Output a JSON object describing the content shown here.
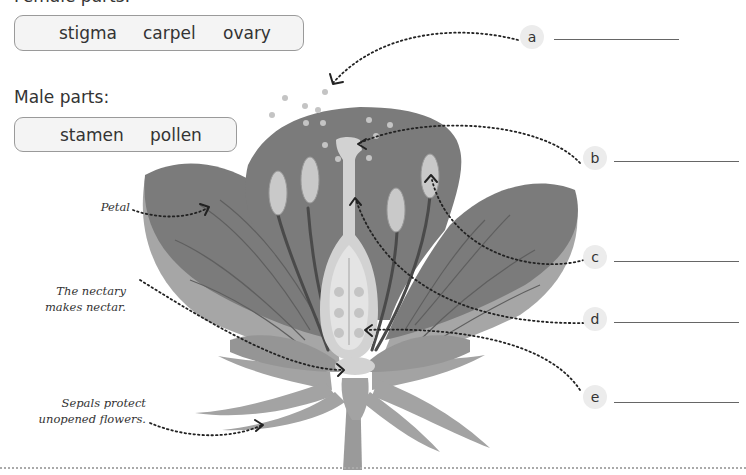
{
  "female_parts": {
    "heading": "Female parts:",
    "words": [
      "stigma",
      "carpel",
      "ovary"
    ]
  },
  "male_parts": {
    "heading": "Male parts:",
    "words": [
      "stamen",
      "pollen"
    ]
  },
  "annotations": {
    "petal": "Petal",
    "nectary_line1": "The nectary",
    "nectary_line2": "makes nectar.",
    "sepals_line1": "Sepals protect",
    "sepals_line2": "unopened flowers."
  },
  "labels": [
    {
      "letter": "a",
      "answer": ""
    },
    {
      "letter": "b",
      "answer": ""
    },
    {
      "letter": "c",
      "answer": ""
    },
    {
      "letter": "d",
      "answer": ""
    },
    {
      "letter": "e",
      "answer": ""
    }
  ],
  "colors": {
    "petal_dark": "#7b7b7b",
    "petal_light": "#a6a6a6",
    "carpel": "#d2d2d2",
    "anther": "#c9c9c9",
    "filament": "#4a4a4a",
    "pollen": "#c4c4c4",
    "badge": "#ececec"
  }
}
